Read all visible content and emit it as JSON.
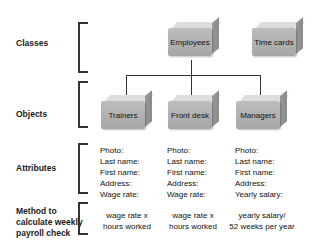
{
  "rows": {
    "classes": "Classes",
    "objects": "Objects",
    "attributes": "Attributes",
    "method": [
      "Method to",
      "calculate weekly",
      "payroll check"
    ]
  },
  "classes": [
    {
      "label": "Employees"
    },
    {
      "label": "Time cards"
    }
  ],
  "objects": [
    {
      "label": "Trainers",
      "attributes": [
        "Photo:",
        "Last name:",
        "First name:",
        "Address:",
        "Wage rate:"
      ],
      "method": [
        "wage rate x",
        "hours worked"
      ]
    },
    {
      "label": "Front desk",
      "attributes": [
        "Photo:",
        "Last name:",
        "First name:",
        "Address:",
        "Wage rate:"
      ],
      "method": [
        "wage rate x",
        "hours worked"
      ]
    },
    {
      "label": "Managers",
      "attributes": [
        "Photo:",
        "Last name:",
        "First name:",
        "Address:",
        "Yearly salary:"
      ],
      "method": [
        "yearly salary/",
        "52 weeks per year"
      ]
    }
  ],
  "colors": {
    "box_front": "#aaaaaa",
    "box_top": "#dedede",
    "lines": "#333333"
  }
}
